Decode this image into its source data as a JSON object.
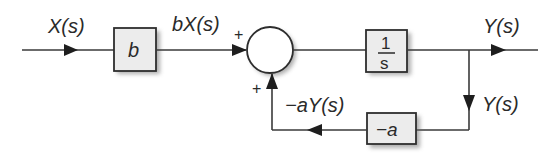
{
  "diagram": {
    "type": "block-diagram",
    "signals": {
      "input": "X(s)",
      "scaled_input": "bX(s)",
      "output": "Y(s)",
      "feedback_branch": "Y(s)",
      "feedback_signal": "−aY(s)"
    },
    "blocks": {
      "gain_b": "b",
      "integrator_num": "1",
      "integrator_den": "s",
      "feedback_gain": "−a"
    },
    "summing_junction": {
      "top_sign": "+",
      "bottom_sign": "+"
    }
  }
}
